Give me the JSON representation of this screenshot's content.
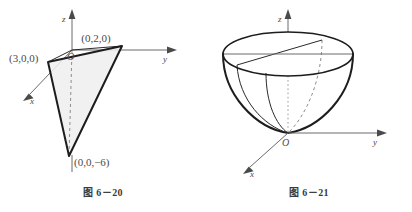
{
  "page": {
    "background": "#ffffff",
    "ink": "#1d1d1d",
    "axis_color": "#6a6a6a",
    "hidden_color": "#8c8c8c",
    "shade_color": "#eeeeee"
  },
  "figures": [
    {
      "id": "fig-6-20",
      "caption": "图 6－20",
      "subject": "plane-triangle-in-3d-axes",
      "axes": {
        "z_label": "z",
        "y_label": "y",
        "x_label": "x",
        "origin_label": "O"
      },
      "vertices": [
        {
          "name": "x-intercept",
          "label": "(3,0,0)"
        },
        {
          "name": "y-intercept",
          "label": "(0,2,0)"
        },
        {
          "name": "z-intercept",
          "label": "(0,0,−6)"
        }
      ]
    },
    {
      "id": "fig-6-21",
      "caption": "图 6－21",
      "subject": "elliptic-paraboloid-opening-upward",
      "axes": {
        "z_label": "z",
        "y_label": "y",
        "x_label": "x",
        "origin_label": "O"
      }
    }
  ]
}
